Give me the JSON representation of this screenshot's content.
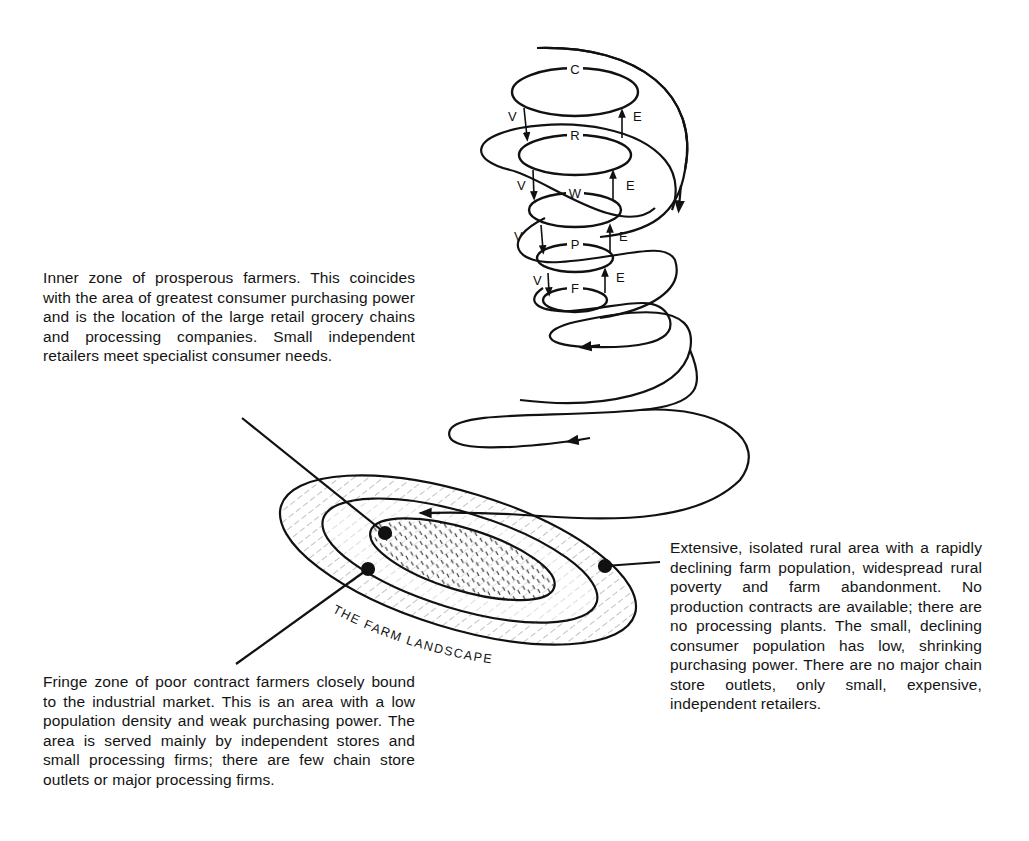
{
  "diagram": {
    "title_label": "THE FARM LANDSCAPE",
    "levels": [
      {
        "code": "C"
      },
      {
        "code": "R"
      },
      {
        "code": "W"
      },
      {
        "code": "P"
      },
      {
        "code": "F"
      }
    ],
    "flow_labels": {
      "down": "V",
      "up": "E"
    },
    "colors": {
      "ink": "#111111",
      "background": "#ffffff"
    }
  },
  "captions": {
    "inner_zone": "Inner zone of prosperous farmers. This coincides with the area of greatest consumer purchasing power and is the location of the large retail grocery chains and processing companies. Small independent retailers meet specialist consumer needs.",
    "fringe_zone": "Fringe zone of poor contract farmers closely bound to the industrial market. This is an area with a low population density and weak purchasing power. The area is served mainly by independent stores and small processing firms; there are few chain store outlets or major processing firms.",
    "outer_zone": "Extensive, isolated rural area with a rapidly declining farm population, widespread rural poverty and farm abandonment. No production contracts are available; there are no processing plants. The small, declining consumer population has low, shrinking purchasing power. There are no major chain store outlets, only small, expensive, independent retailers."
  }
}
